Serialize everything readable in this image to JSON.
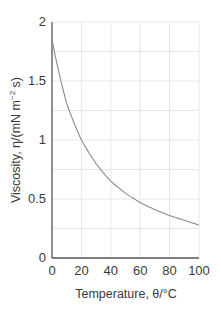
{
  "chart_data": {
    "type": "line",
    "title": "",
    "xlabel": "Temperature, θ/°C",
    "ylabel": "Viscosity, η/(mN m⁻² s)",
    "xlim": [
      0,
      100
    ],
    "ylim": [
      0,
      2
    ],
    "x_ticks": [
      "0",
      "20",
      "40",
      "60",
      "80",
      "100"
    ],
    "y_ticks": [
      "0",
      "0.5",
      "1",
      "1.5",
      "2"
    ],
    "grid": true,
    "grid_y_step": 0.25,
    "grid_x_step": 20,
    "legend": null,
    "series": [
      {
        "name": "Viscosity of water",
        "x": [
          0,
          10,
          20,
          30,
          40,
          50,
          60,
          70,
          80,
          90,
          100
        ],
        "values": [
          1.85,
          1.31,
          1.0,
          0.8,
          0.65,
          0.55,
          0.47,
          0.41,
          0.36,
          0.32,
          0.28
        ]
      }
    ],
    "colors": {
      "line": "#8a8a8a",
      "axis": "#555555",
      "grid": "#e6e6e6"
    }
  },
  "labels": {
    "x_axis": "Temperature,  θ/°C",
    "y_axis_main": "Viscosity, η/(mN m",
    "y_axis_sup": "−2",
    "y_axis_end": " s)"
  }
}
